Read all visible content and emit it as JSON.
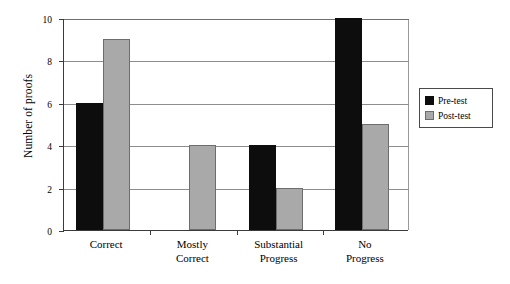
{
  "chart_data": {
    "type": "bar",
    "title": "",
    "xlabel": "",
    "ylabel": "Number of proofs",
    "categories": [
      "Correct",
      "Mostly\nCorrect",
      "Substantial\nProgress",
      "No\nProgress"
    ],
    "series": [
      {
        "name": "Pre-test",
        "color": "#0d0d0d",
        "values": [
          6,
          0,
          4,
          10
        ]
      },
      {
        "name": "Post-test",
        "color": "#a9a9a9",
        "values": [
          9,
          4,
          2,
          5
        ]
      }
    ],
    "ylim": [
      0,
      10
    ],
    "yticks": [
      0,
      2,
      4,
      6,
      8,
      10
    ],
    "ytick_labels": [
      "0",
      "2",
      "4",
      "6",
      "8",
      "10"
    ],
    "grid": "horizontal",
    "legend_position": "right-outside",
    "legend_entries": [
      "Pre-test",
      "Post-test"
    ],
    "background": "#ffffff",
    "axis_color": "#3b3b3b",
    "grid_color": "#8e8e8e"
  }
}
